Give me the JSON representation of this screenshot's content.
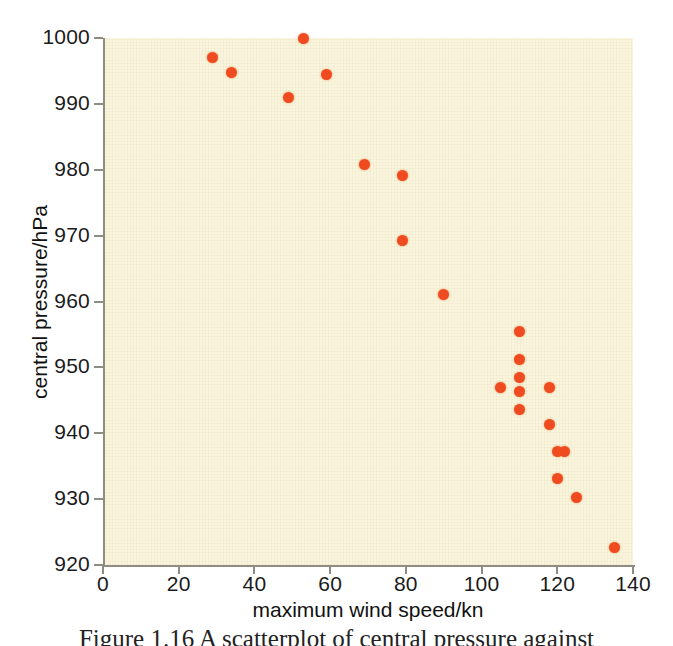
{
  "chart_data": {
    "type": "scatter",
    "title": "",
    "xlabel": "maximum wind speed/kn",
    "ylabel": "central pressure/hPa",
    "xlim": [
      0,
      140
    ],
    "ylim": [
      920,
      1000
    ],
    "xticks": [
      0,
      20,
      40,
      60,
      80,
      100,
      120,
      140
    ],
    "yticks": [
      920,
      930,
      940,
      950,
      960,
      970,
      980,
      990,
      1000
    ],
    "xtick_labels": [
      "0",
      "20",
      "40",
      "60",
      "80",
      "100",
      "120",
      "140"
    ],
    "ytick_labels": [
      "920",
      "930",
      "940",
      "950",
      "960",
      "970",
      "980",
      "990",
      "1000"
    ],
    "grid": false,
    "legend": null,
    "marker": {
      "shape": "circle",
      "color": "#f04b20",
      "size_px": 11
    },
    "points": [
      {
        "x": 29,
        "y": 997.0
      },
      {
        "x": 34,
        "y": 994.8
      },
      {
        "x": 49,
        "y": 990.9
      },
      {
        "x": 53,
        "y": 1000.0
      },
      {
        "x": 59,
        "y": 994.4
      },
      {
        "x": 69,
        "y": 980.8
      },
      {
        "x": 79,
        "y": 979.1
      },
      {
        "x": 79,
        "y": 969.3
      },
      {
        "x": 90,
        "y": 961.0
      },
      {
        "x": 105,
        "y": 947.0
      },
      {
        "x": 110,
        "y": 955.5
      },
      {
        "x": 110,
        "y": 951.2
      },
      {
        "x": 110,
        "y": 948.4
      },
      {
        "x": 110,
        "y": 946.4
      },
      {
        "x": 110,
        "y": 943.6
      },
      {
        "x": 118,
        "y": 947.0
      },
      {
        "x": 118,
        "y": 941.4
      },
      {
        "x": 120,
        "y": 937.2
      },
      {
        "x": 122,
        "y": 937.2
      },
      {
        "x": 120,
        "y": 933.2
      },
      {
        "x": 125,
        "y": 930.3
      },
      {
        "x": 135,
        "y": 922.7
      }
    ]
  },
  "style": {
    "panel_background": "#faf5dc",
    "figure_background": "#ffffff",
    "axis_color": "#8f8d82",
    "text_color": "#1b1b1b",
    "marker_color": "#f04b20"
  },
  "caption": {
    "partial_text": "Figure 1.16 A scatterplot of central pressure against"
  }
}
